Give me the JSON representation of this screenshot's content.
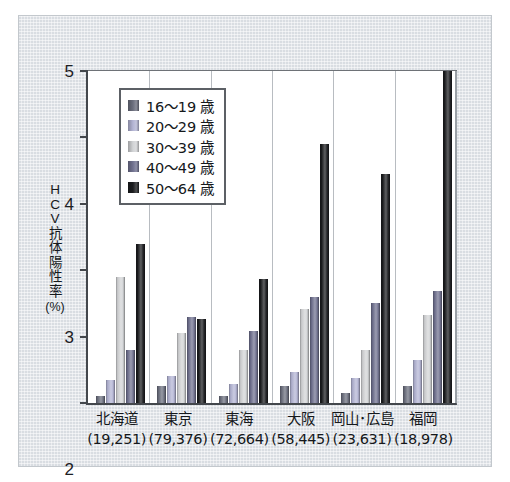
{
  "chart_data": {
    "type": "bar",
    "title": "",
    "xlabel": "",
    "ylabel": "HCV抗体陽性率 (%)",
    "ylabel_chars": [
      "H",
      "C",
      "V",
      "抗",
      "体",
      "陽",
      "性",
      "率"
    ],
    "ylabel_unit": "(%)",
    "ylim": [
      0,
      5
    ],
    "yticks": [
      "0",
      "1",
      "2",
      "3",
      "4",
      "5"
    ],
    "ytick_values": [
      0,
      1,
      2,
      3,
      4,
      5
    ],
    "grid": false,
    "legend_position": "top-left",
    "categories": [
      "北海道",
      "東京",
      "東海",
      "大阪",
      "岡山･広島",
      "福岡"
    ],
    "category_counts": [
      "(19,251)",
      "(79,376)",
      "(72,664)",
      "(58,445)",
      "(23,631)",
      "(18,978)"
    ],
    "series": [
      {
        "name": "16～19 歳",
        "color": "#6b6e7d",
        "values": [
          0.1,
          0.25,
          0.1,
          0.25,
          0.15,
          0.26
        ]
      },
      {
        "name": "20～29 歳",
        "color": "#b3b4d4",
        "values": [
          0.35,
          0.4,
          0.28,
          0.47,
          0.38,
          0.65
        ]
      },
      {
        "name": "30～39 歳",
        "color": "#d2d4d6",
        "values": [
          1.9,
          1.05,
          0.8,
          1.42,
          0.8,
          1.32
        ]
      },
      {
        "name": "40～49 歳",
        "color": "#70718f",
        "values": [
          0.8,
          1.3,
          1.08,
          1.6,
          1.5,
          1.68
        ]
      },
      {
        "name": "50～64 歳",
        "color": "#1b1c1f",
        "values": [
          2.4,
          1.27,
          1.87,
          3.9,
          3.45,
          5.0
        ]
      }
    ]
  },
  "figure": {
    "background_color": "#d9dde2",
    "plot_background_color": "#ffffff",
    "axis_color": "#43474c"
  }
}
